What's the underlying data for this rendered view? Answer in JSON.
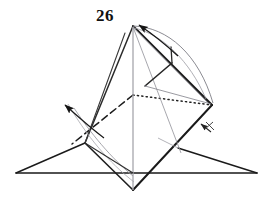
{
  "figure": {
    "caption_number": "26",
    "colors": {
      "ink_dark": "#1a1a1a",
      "ink_mid": "#3d3d3d",
      "ink_light": "#9a9aa0",
      "background": "#ffffff"
    },
    "icons": {
      "fold_arrow_top": "fold-arrow-up-right",
      "fold_arrow_left": "fold-arrow-up-left",
      "fold_arrow_small": "small-fold-arrow-with-tick",
      "hidden_edge": "dotted-hidden-edge",
      "valley_crease": "dashed-valley-crease"
    },
    "geometry": {
      "apex": [
        133,
        26
      ],
      "right_vertex": [
        212,
        105
      ],
      "left_vertex": [
        85,
        143
      ],
      "bottom_vertex": [
        133,
        190
      ],
      "baseline_left": [
        16,
        173
      ],
      "baseline_right": [
        257,
        173
      ],
      "center": [
        133,
        95
      ]
    },
    "labels": {
      "step": "26"
    }
  }
}
